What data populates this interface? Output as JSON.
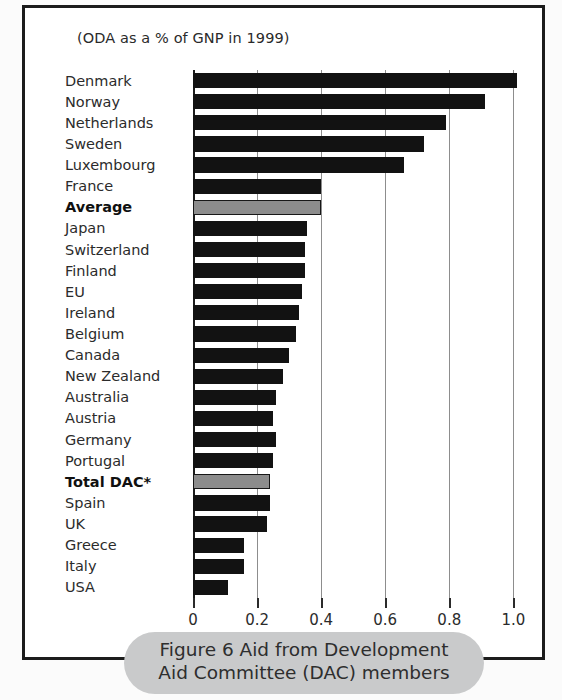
{
  "figure": {
    "subtitle": "(ODA as a % of GNP in 1999)",
    "caption": "Figure 6 Aid from Development Aid Committee (DAC) members",
    "bar_color": "#121212",
    "highlight_color": "#8c8c8c",
    "caption_background": "#c9cacb",
    "frame_color": "#1c1c1c"
  },
  "chart_data": {
    "type": "bar",
    "orientation": "horizontal",
    "title": "Figure 6 Aid from Development Aid Committee (DAC) members",
    "subtitle": "(ODA as a % of GNP in 1999)",
    "xlabel": "",
    "ylabel": "",
    "xlim": [
      0,
      1.08
    ],
    "xticks": [
      0,
      0.2,
      0.4,
      0.6,
      0.8,
      1.0
    ],
    "xticklabels": [
      "0",
      "0.2",
      "0.4",
      "0.6",
      "0.8",
      "1.0"
    ],
    "grid": true,
    "legend": null,
    "categories": [
      "Denmark",
      "Norway",
      "Netherlands",
      "Sweden",
      "Luxembourg",
      "France",
      "Average",
      "Japan",
      "Switzerland",
      "Finland",
      "EU",
      "Ireland",
      "Belgium",
      "Canada",
      "New Zealand",
      "Australia",
      "Austria",
      "Germany",
      "Portugal",
      "Total DAC*",
      "Spain",
      "UK",
      "Greece",
      "Italy",
      "USA"
    ],
    "values": [
      1.01,
      0.91,
      0.79,
      0.72,
      0.66,
      0.4,
      0.4,
      0.355,
      0.35,
      0.35,
      0.34,
      0.33,
      0.32,
      0.3,
      0.28,
      0.26,
      0.25,
      0.26,
      0.25,
      0.24,
      0.24,
      0.23,
      0.16,
      0.16,
      0.11
    ],
    "highlighted": [
      "Average",
      "Total DAC*"
    ]
  }
}
